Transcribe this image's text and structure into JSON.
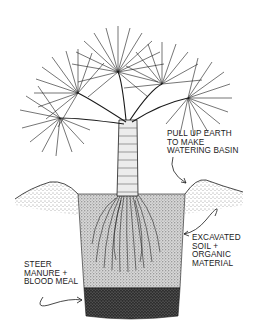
{
  "diagram": {
    "colors": {
      "ink": "#1a1a1a",
      "background": "#ffffff",
      "soil": "#cfcfcf",
      "manure": "#3a3a3a"
    },
    "labels": {
      "watering_basin": {
        "lines": [
          "PULL UP EARTH",
          "TO MAKE",
          "WATERING BASIN"
        ]
      },
      "excavated_soil": {
        "lines": [
          "EXCAVATED",
          "SOIL +",
          "ORGANIC",
          "MATERIAL"
        ]
      },
      "manure": {
        "lines": [
          "STEER",
          "MANURE +",
          "BLOOD MEAL"
        ]
      }
    }
  }
}
